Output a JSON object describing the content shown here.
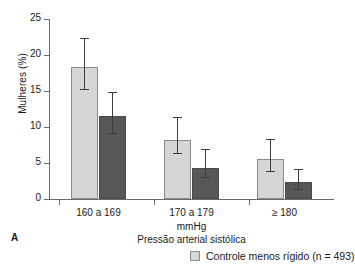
{
  "panel": {
    "label": "A"
  },
  "axes": {
    "ylabel": "Mulheres (%)",
    "unit_label": "mmHg",
    "xaxis_title": "Pressão arterial sistólica",
    "yticks": [
      "0",
      "5",
      "10",
      "15",
      "20",
      "25"
    ]
  },
  "legend": {
    "entries": [
      {
        "label": "Controle menos rígido (n = 493)",
        "color": "#d6d6d6",
        "swatch_name": "legend-swatch-light"
      }
    ]
  },
  "colors": {
    "series_light": "#d6d6d6",
    "series_dark": "#575757",
    "axis": "#6b6b6b",
    "error_bar": "#3d3d3d",
    "background": "#ffffff"
  },
  "chart_data": {
    "type": "bar",
    "title": "",
    "xlabel": "Pressão arterial sistólica",
    "ylabel": "Mulheres (%)",
    "unit": "mmHg",
    "categories": [
      "160 a 169",
      "170 a 179",
      "≥ 180"
    ],
    "ylim": [
      0,
      25
    ],
    "yticks": [
      0,
      5,
      10,
      15,
      20,
      25
    ],
    "grid": false,
    "legend_position": "bottom-right",
    "series": [
      {
        "name": "Controle menos rígido (n = 493)",
        "color": "#d6d6d6",
        "values": [
          18.4,
          8.2,
          5.6
        ],
        "error_low": [
          15.2,
          6.2,
          3.8
        ],
        "error_high": [
          22.2,
          11.3,
          8.2
        ]
      },
      {
        "name": "",
        "color": "#575757",
        "values": [
          11.5,
          4.3,
          2.3
        ],
        "error_low": [
          9.0,
          2.9,
          1.3
        ],
        "error_high": [
          14.7,
          6.8,
          4.0
        ]
      }
    ]
  }
}
